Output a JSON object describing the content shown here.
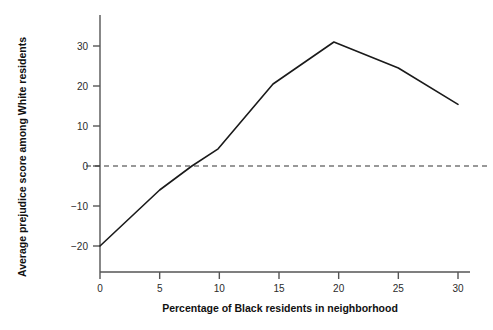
{
  "chart_data": {
    "type": "line",
    "title": "",
    "xlabel": "Percentage of Black residents in neighborhood",
    "ylabel": "Average prejudice score among White residents",
    "xlim": [
      -0.6,
      30.8
    ],
    "ylim": [
      -27.0,
      39.0
    ],
    "xticks": [
      0,
      5,
      10,
      15,
      20,
      25,
      30
    ],
    "xtick_labels": [
      "0",
      "5",
      "10",
      "15",
      "20",
      "25",
      "30"
    ],
    "yticks": [
      -20,
      -10,
      0,
      10,
      20,
      30
    ],
    "ytick_labels": [
      "−20",
      "−10",
      "0",
      "10",
      "20",
      "30"
    ],
    "grid": false,
    "legend": null,
    "reference_lines": [
      {
        "name": "zero-line",
        "orientation": "horizontal",
        "value": 0,
        "style": "dashed",
        "color": "#333333"
      }
    ],
    "series": [
      {
        "name": "Average prejudice score",
        "color": "#1a1a1a",
        "line_width": 1.6,
        "x": [
          0.0,
          5.0,
          7.7,
          9.9,
          14.5,
          19.6,
          25.0,
          30.0
        ],
        "y": [
          -20.0,
          -6.0,
          0.0,
          4.3,
          20.5,
          31.0,
          24.5,
          15.4
        ]
      }
    ]
  },
  "axes": {
    "x_axis_name": "x-axis",
    "y_axis_name": "y-axis"
  }
}
